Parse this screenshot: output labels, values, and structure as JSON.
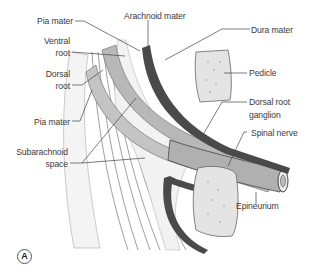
{
  "figure": {
    "panel_label": "A",
    "colors": {
      "dura": "#4a4a4a",
      "nerve_root": "#b8b8b8",
      "bone": "#e4e4e4",
      "line": "#555555",
      "text": "#3a3a3a"
    }
  },
  "labels": {
    "pia_mater_top": "Pia mater",
    "arachnoid_mater": "Arachnoid mater",
    "dura_mater": "Dura mater",
    "ventral_root_1": "Ventral",
    "ventral_root_2": "root",
    "dorsal_root_1": "Dorsal",
    "dorsal_root_2": "root",
    "pedicle": "Pedicle",
    "pia_mater_bottom": "Pia mater",
    "drg_1": "Dorsal root",
    "drg_2": "ganglion",
    "spinal_nerve": "Spinal nerve",
    "subarachnoid_1": "Subarachnoid",
    "subarachnoid_2": "space",
    "epineurium": "Epineurium"
  }
}
